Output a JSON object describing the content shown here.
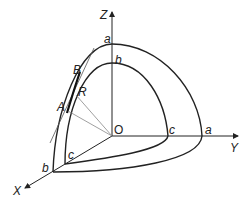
{
  "diagram": {
    "title": "",
    "axes": {
      "x": "X",
      "y": "Y",
      "z": "Z",
      "origin": "O"
    },
    "outer_surface_labels": {
      "z_intercept": "a",
      "y_intercept": "a",
      "x_intercept": "b"
    },
    "inner_surface_labels": {
      "z_intercept": "b",
      "y_intercept": "c",
      "x_intercept": "c"
    },
    "points": {
      "B": "B",
      "R": "R",
      "A": "A"
    },
    "colors": {
      "stroke": "#222222",
      "thin": "#888888",
      "background": "#ffffff"
    }
  }
}
